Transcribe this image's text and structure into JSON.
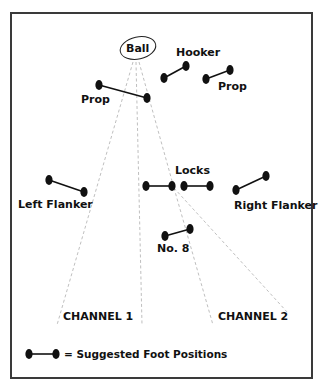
{
  "diagram": {
    "ball_label": "Ball",
    "players": [
      {
        "id": "hooker",
        "label": "Hooker"
      },
      {
        "id": "prop-left",
        "label": "Prop"
      },
      {
        "id": "prop-right",
        "label": "Prop"
      },
      {
        "id": "locks",
        "label": "Locks"
      },
      {
        "id": "left-flanker",
        "label": "Left Flanker"
      },
      {
        "id": "right-flanker",
        "label": "Right Flanker"
      },
      {
        "id": "number-8",
        "label": "No. 8"
      }
    ],
    "channels": [
      {
        "label": "CHANNEL 1"
      },
      {
        "label": "CHANNEL 2"
      }
    ],
    "legend": {
      "label": "= Suggested Foot Positions",
      "icon": "foot-position-icon"
    },
    "colors": {
      "feet": "#111111",
      "dashed_lines": "#b8b8b8",
      "frame": "#3a3a3a"
    }
  }
}
